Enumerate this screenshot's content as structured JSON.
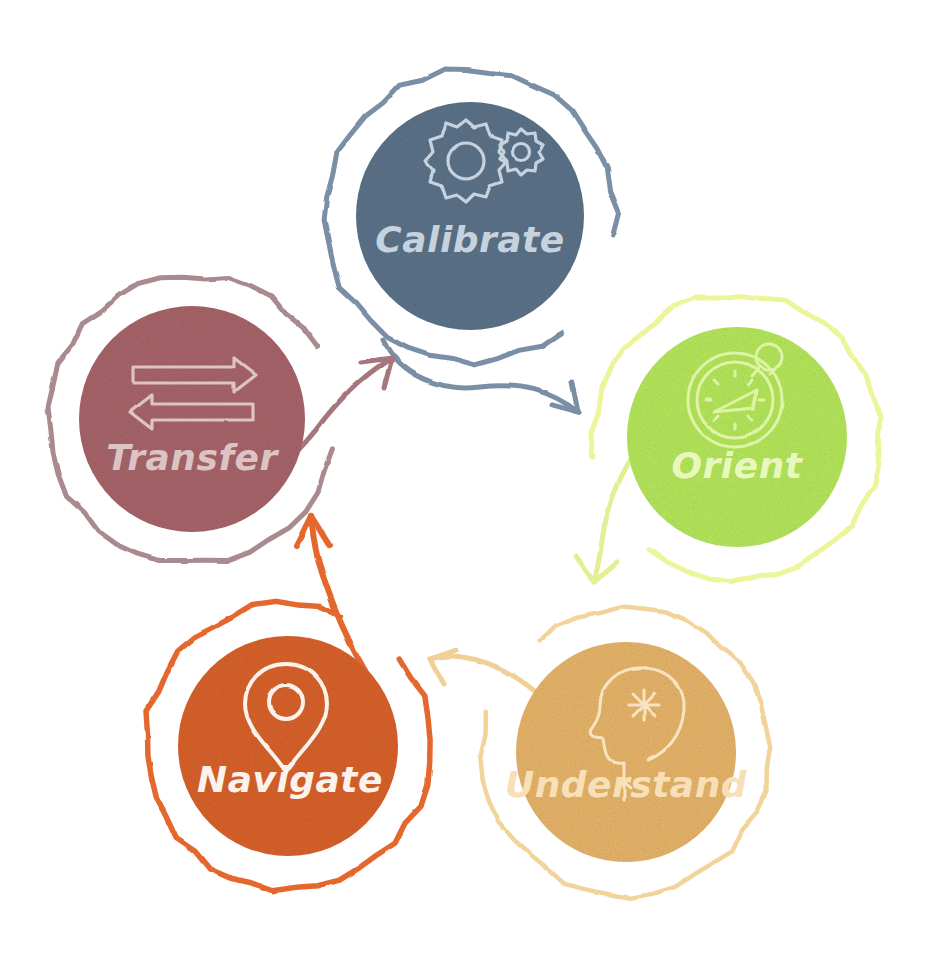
{
  "diagram": {
    "type": "cycle",
    "title": "",
    "style": "hand-drawn sketch",
    "background": "#ffffff",
    "node_count": 5,
    "direction": "clockwise"
  },
  "nodes": [
    {
      "id": "calibrate",
      "label": "Calibrate",
      "icon": "gears-icon",
      "position": "top",
      "cx": 470,
      "cy": 216,
      "fill": "#5C738A",
      "ring": "#7A8FA6",
      "label_color": "#C6D2DD",
      "icon_color": "#C6D2DD",
      "accent_line": false,
      "accent_color": "",
      "ring_gap_start": 8,
      "ring_gap_end": 52
    },
    {
      "id": "orient",
      "label": "Orient",
      "icon": "compass-icon",
      "position": "right",
      "cx": 737,
      "cy": 437,
      "fill": "#B6E85C",
      "ring": "#EDF59A",
      "label_color": "#E8F7BE",
      "icon_color": "#DFF3A6",
      "accent_line": true,
      "accent_color": "#EDF29B",
      "ring_gap_start": 128,
      "ring_gap_end": 172
    },
    {
      "id": "understand",
      "label": "Understand",
      "icon": "head-insight-icon",
      "position": "bottom-right",
      "cx": 626,
      "cy": 752,
      "fill": "#E8B56A",
      "ring": "#F2D49A",
      "label_color": "#F7E0B8",
      "icon_color": "#F7E3BF",
      "accent_line": false,
      "accent_color": "",
      "ring_gap_start": 196,
      "ring_gap_end": 232
    },
    {
      "id": "navigate",
      "label": "Navigate",
      "icon": "map-pin-icon",
      "position": "bottom-left",
      "cx": 288,
      "cy": 746,
      "fill": "#D9622B",
      "ring": "#E4682F",
      "label_color": "#FBF2EC",
      "icon_color": "#FBF2EC",
      "accent_line": false,
      "accent_color": "",
      "ring_gap_start": 292,
      "ring_gap_end": 322
    },
    {
      "id": "transfer",
      "label": "Transfer",
      "icon": "exchange-arrows-icon",
      "position": "left",
      "cx": 192,
      "cy": 419,
      "fill": "#A8656A",
      "ring": "#A98A8E",
      "label_color": "#DCC4C4",
      "icon_color": "#DCC4C4",
      "accent_line": true,
      "accent_color": "#E89A57",
      "ring_gap_start": 330,
      "ring_gap_end": 12
    }
  ],
  "arrows": [
    {
      "id": "calibrate-to-orient",
      "from": "calibrate",
      "to": "orient",
      "color": "#7A8FA6"
    },
    {
      "id": "orient-to-understand",
      "from": "orient",
      "to": "understand",
      "color": "#E4EE93"
    },
    {
      "id": "understand-to-navigate",
      "from": "understand",
      "to": "navigate",
      "color": "#F0D098"
    },
    {
      "id": "navigate-to-transfer",
      "from": "navigate",
      "to": "transfer",
      "color": "#E4682F"
    },
    {
      "id": "transfer-to-calibrate",
      "from": "transfer",
      "to": "calibrate",
      "color": "#A5777C"
    }
  ]
}
